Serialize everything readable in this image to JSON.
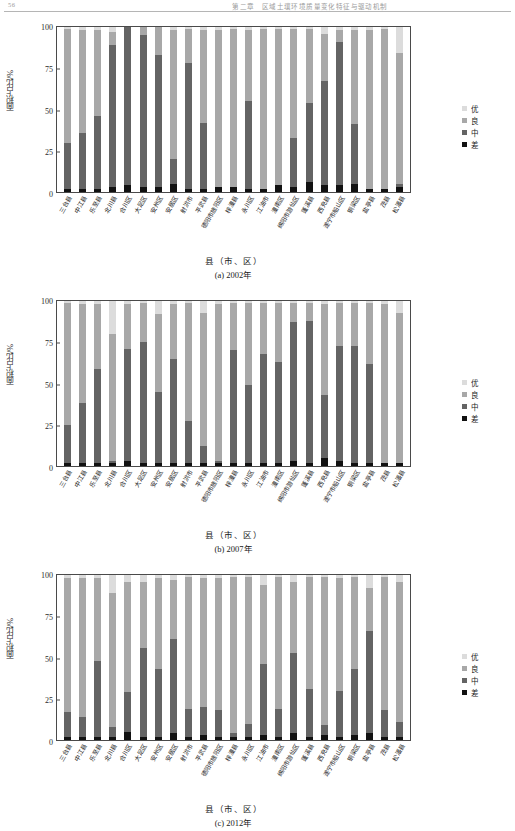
{
  "header": {
    "folio": "56",
    "running_title": "第二章　区域土壤环境质量变化特征与驱动机制"
  },
  "legend": {
    "position": "right",
    "items": [
      {
        "label": "优",
        "color": "#dcdcdc"
      },
      {
        "label": "良",
        "color": "#a8a8a8"
      },
      {
        "label": "中",
        "color": "#646464"
      },
      {
        "label": "差",
        "color": "#111111"
      }
    ]
  },
  "axis": {
    "ylabel": "面积占比/%",
    "xlabel": "县（市、区）",
    "yticks": [
      "0",
      "25",
      "50",
      "75",
      "100"
    ],
    "ylim": [
      0,
      100
    ]
  },
  "categories": [
    "三台县",
    "中江县",
    "乐至县",
    "北川县",
    "合川区",
    "大足区",
    "安州区",
    "安居区",
    "射洪市",
    "平武县",
    "德阳市旌阳区",
    "梓潼县",
    "永川区",
    "江油市",
    "潼南区",
    "绵阳市游仙区",
    "蓬溪县",
    "西充县",
    "遂宁市船山区",
    "铜梁区",
    "盐亭县",
    "茂县",
    "松潘县"
  ],
  "chart_data": [
    {
      "type": "bar",
      "stacked": true,
      "title": "(a) 2002年",
      "xlabel": "县（市、区）",
      "ylabel": "面积占比/%",
      "ylim": [
        0,
        100
      ],
      "grid": false,
      "legend_position": "right",
      "categories": [
        "三台县",
        "中江县",
        "乐至县",
        "北川县",
        "合川区",
        "大足区",
        "安州区",
        "安居区",
        "射洪市",
        "平武县",
        "德阳市旌阳区",
        "梓潼县",
        "永川区",
        "江油市",
        "潼南区",
        "绵阳市游仙区",
        "蓬溪县",
        "西充县",
        "遂宁市船山区",
        "铜梁区",
        "盐亭县",
        "茂县",
        "松潘县"
      ],
      "series": [
        {
          "name": "差",
          "color": "#111111",
          "values": [
            2,
            2,
            2,
            3,
            4,
            3,
            3,
            5,
            2,
            2,
            3,
            3,
            2,
            2,
            4,
            3,
            6,
            4,
            4,
            5,
            2,
            2,
            3
          ]
        },
        {
          "name": "中",
          "color": "#646464",
          "values": [
            28,
            34,
            44,
            86,
            96,
            92,
            80,
            15,
            76,
            40,
            0,
            0,
            53,
            0,
            0,
            30,
            48,
            63,
            87,
            36,
            0,
            0,
            2
          ]
        },
        {
          "name": "良",
          "color": "#a8a8a8",
          "values": [
            69,
            62,
            52,
            8,
            0,
            5,
            17,
            78,
            21,
            56,
            95,
            96,
            43,
            97,
            95,
            66,
            45,
            29,
            7,
            57,
            96,
            97,
            79
          ]
        },
        {
          "name": "优",
          "color": "#dcdcdc",
          "values": [
            1,
            2,
            2,
            3,
            0,
            0,
            0,
            2,
            1,
            2,
            2,
            1,
            2,
            1,
            1,
            1,
            1,
            4,
            2,
            2,
            2,
            1,
            16
          ]
        }
      ]
    },
    {
      "type": "bar",
      "stacked": true,
      "title": "(b) 2007年",
      "xlabel": "县（市、区）",
      "ylabel": "面积占比/%",
      "ylim": [
        0,
        100
      ],
      "grid": false,
      "legend_position": "right",
      "categories": [
        "三台县",
        "中江县",
        "乐至县",
        "北川县",
        "合川区",
        "大足区",
        "安州区",
        "安居区",
        "射洪市",
        "平武县",
        "德阳市旌阳区",
        "梓潼县",
        "永川区",
        "江油市",
        "潼南区",
        "绵阳市游仙区",
        "蓬溪县",
        "西充县",
        "遂宁市船山区",
        "铜梁区",
        "盐亭县",
        "茂县",
        "松潘县"
      ],
      "series": [
        {
          "name": "差",
          "color": "#111111",
          "values": [
            2,
            2,
            2,
            2,
            3,
            2,
            2,
            2,
            2,
            2,
            2,
            2,
            2,
            2,
            2,
            3,
            2,
            5,
            3,
            2,
            2,
            2,
            2
          ]
        },
        {
          "name": "中",
          "color": "#646464",
          "values": [
            23,
            36,
            57,
            1,
            68,
            73,
            43,
            63,
            25,
            10,
            1,
            68,
            47,
            66,
            61,
            84,
            86,
            38,
            70,
            71,
            60,
            0,
            0
          ]
        },
        {
          "name": "良",
          "color": "#a8a8a8",
          "values": [
            74,
            60,
            39,
            77,
            27,
            24,
            47,
            33,
            72,
            81,
            95,
            29,
            50,
            31,
            36,
            12,
            11,
            55,
            26,
            26,
            37,
            96,
            91
          ]
        },
        {
          "name": "优",
          "color": "#dcdcdc",
          "values": [
            1,
            2,
            2,
            20,
            2,
            1,
            8,
            2,
            1,
            7,
            2,
            1,
            1,
            1,
            1,
            1,
            1,
            2,
            1,
            1,
            1,
            2,
            7
          ]
        }
      ]
    },
    {
      "type": "bar",
      "stacked": true,
      "title": "(c) 2012年",
      "xlabel": "县（市、区）",
      "ylabel": "面积占比/%",
      "ylim": [
        0,
        100
      ],
      "grid": false,
      "legend_position": "right",
      "categories": [
        "三台县",
        "中江县",
        "乐至县",
        "北川县",
        "合川区",
        "大足区",
        "安州区",
        "安居区",
        "射洪市",
        "平武县",
        "德阳市旌阳区",
        "梓潼县",
        "永川区",
        "江油市",
        "潼南区",
        "绵阳市游仙区",
        "蓬溪县",
        "西充县",
        "遂宁市船山区",
        "铜梁区",
        "盐亭县",
        "茂县",
        "松潘县"
      ],
      "series": [
        {
          "name": "差",
          "color": "#111111",
          "values": [
            2,
            2,
            2,
            2,
            5,
            2,
            2,
            4,
            2,
            3,
            2,
            2,
            2,
            3,
            2,
            4,
            2,
            3,
            2,
            3,
            4,
            2,
            2
          ]
        },
        {
          "name": "中",
          "color": "#646464",
          "values": [
            15,
            12,
            46,
            6,
            24,
            54,
            41,
            57,
            17,
            17,
            16,
            2,
            8,
            43,
            17,
            49,
            29,
            6,
            28,
            40,
            62,
            16,
            9
          ]
        },
        {
          "name": "良",
          "color": "#a8a8a8",
          "values": [
            81,
            84,
            50,
            81,
            67,
            40,
            55,
            36,
            80,
            78,
            80,
            95,
            89,
            48,
            80,
            43,
            68,
            90,
            68,
            56,
            26,
            81,
            85
          ]
        },
        {
          "name": "优",
          "color": "#dcdcdc",
          "values": [
            2,
            2,
            2,
            11,
            4,
            4,
            2,
            3,
            1,
            2,
            2,
            1,
            1,
            6,
            1,
            4,
            1,
            1,
            2,
            1,
            8,
            1,
            4
          ]
        }
      ]
    }
  ]
}
